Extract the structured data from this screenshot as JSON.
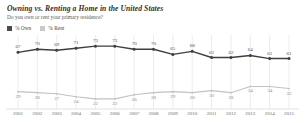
{
  "header": {
    "title": "Owning vs. Renting a Home in the United States",
    "subtitle": "Do you own or rent your primary residence?"
  },
  "legend": {
    "items": [
      {
        "label": "% Own",
        "color": "#4a4a4a",
        "name": "own"
      },
      {
        "label": "% Rent",
        "color": "#c9c9c9",
        "name": "rent"
      }
    ]
  },
  "colors": {
    "own_line": "#3f3f3f",
    "rent_line": "#c2c2c2",
    "gridline": "#d8d8d8",
    "baseline": "#cfcfcf",
    "text": "#5c5c5c"
  },
  "chart_data": {
    "type": "line",
    "title": "Owning vs. Renting a Home in the United States",
    "subtitle": "Do you own or rent your primary residence?",
    "xlabel": "",
    "ylabel": "",
    "ylim": [
      0,
      100
    ],
    "grid": true,
    "legend_position": "top-left",
    "categories": [
      "2001",
      "2002",
      "2003",
      "2004",
      "2005",
      "2006",
      "2007",
      "2008",
      "2009",
      "2010",
      "2011",
      "2012",
      "2013",
      "2014",
      "2015"
    ],
    "series": [
      {
        "name": "% Own",
        "color": "#3f3f3f",
        "values": [
          67,
          70,
          69,
          71,
          73,
          73,
          70,
          70,
          65,
          68,
          62,
          62,
          64,
          61,
          61
        ]
      },
      {
        "name": "% Rent",
        "color": "#c2c2c2",
        "values": [
          29,
          28,
          27,
          24,
          22,
          22,
          26,
          28,
          29,
          28,
          30,
          28,
          34,
          34,
          32
        ]
      }
    ]
  }
}
